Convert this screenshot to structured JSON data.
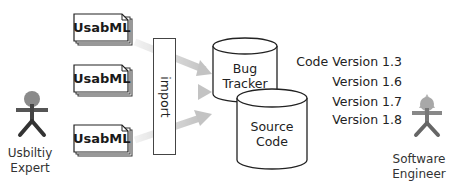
{
  "diagram": {
    "documents": [
      {
        "label": "UsabML"
      },
      {
        "label": "UsabML"
      },
      {
        "label": "UsabML"
      }
    ],
    "import_label": "import",
    "actors": {
      "left": {
        "line1": "Usbiltiy",
        "line2": "Expert",
        "color": "#8a8a8a"
      },
      "right": {
        "line1": "Software",
        "line2": "Engineer",
        "color": "#9a9a9a"
      }
    },
    "databases": {
      "bug_tracker": {
        "line1": "Bug",
        "line2": "Tracker"
      },
      "source_code": {
        "line1": "Source",
        "line2": "Code"
      }
    },
    "versions": [
      "Code Version 1.3",
      "Version 1.6",
      "Version 1.7",
      "Version 1.8"
    ],
    "colors": {
      "arrow": "#c8c8c8",
      "stroke": "#333333",
      "shadow": "#bbbbbb"
    }
  }
}
